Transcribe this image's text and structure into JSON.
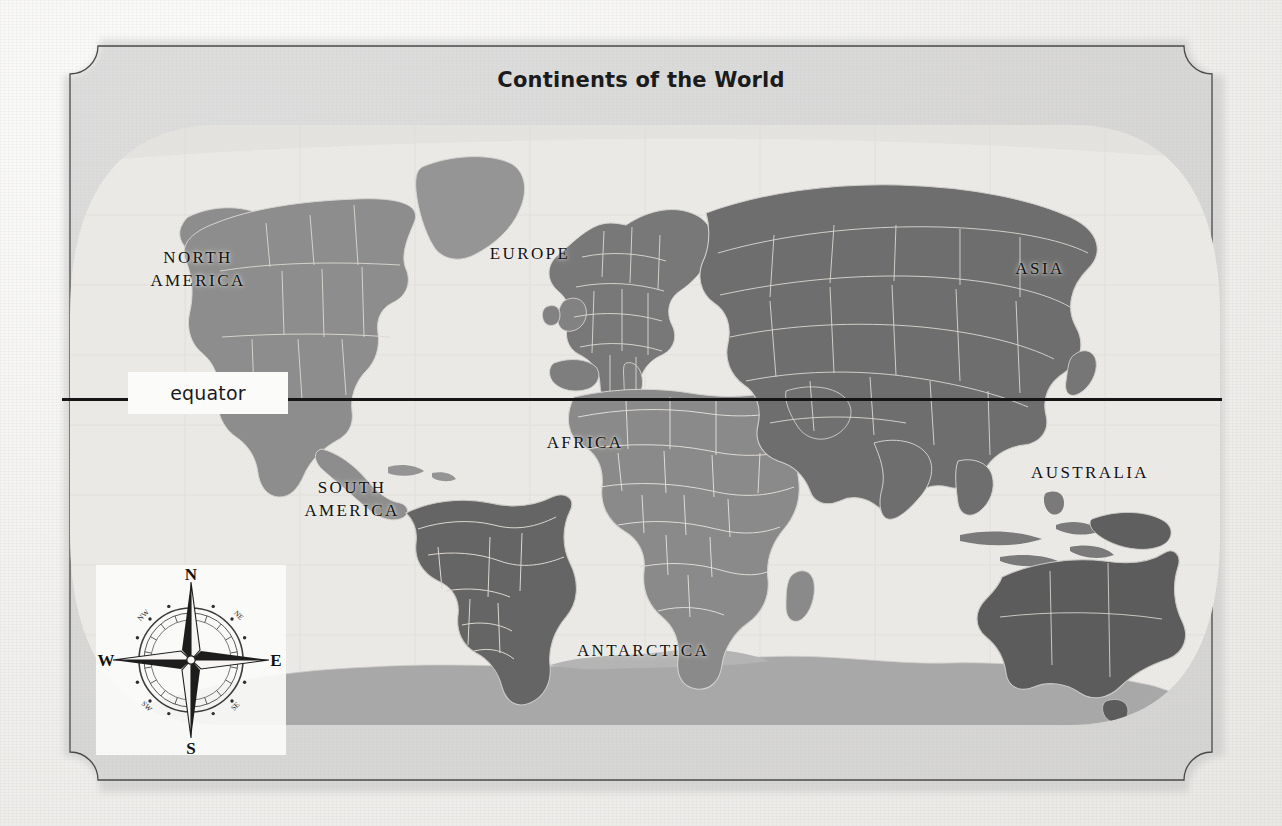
{
  "map": {
    "title": "Continents of the World",
    "equator": {
      "label": "equator"
    },
    "continents": [
      {
        "name": "NORTH\nAMERICA",
        "key": "north-america",
        "x": 128,
        "y": 247,
        "w": 140,
        "shade": "#8c8c8c"
      },
      {
        "name": "SOUTH\nAMERICA",
        "key": "south-america",
        "x": 282,
        "y": 477,
        "w": 140,
        "shade": "#6d6d6d"
      },
      {
        "name": "EUROPE",
        "key": "europe",
        "x": 445,
        "y": 243,
        "w": 170,
        "shade": "#7a7a7a"
      },
      {
        "name": "AFRICA",
        "key": "africa",
        "x": 500,
        "y": 432,
        "w": 170,
        "shade": "#8c8c8c"
      },
      {
        "name": "ASIA",
        "key": "asia",
        "x": 955,
        "y": 258,
        "w": 170,
        "shade": "#6f6f6f"
      },
      {
        "name": "AUSTRALIA",
        "key": "australia",
        "x": 1000,
        "y": 462,
        "w": 180,
        "shade": "#5f5f5f"
      },
      {
        "name": "ANTARCTICA",
        "key": "antarctica",
        "x": 538,
        "y": 640,
        "w": 210,
        "shade": "#aaaaaa"
      }
    ],
    "compass": {
      "north": "N",
      "south": "S",
      "east": "E",
      "west": "W",
      "northeast": "NE",
      "northwest": "NW",
      "southeast": "SE",
      "southwest": "SW"
    },
    "colors": {
      "paper": "#f4f3f1",
      "ocean": "#eceae7",
      "frame_line": "#3a3a3a",
      "equator_line": "#151515",
      "label_text": "#121212",
      "land_dark": "#5f5f5f",
      "land_mid": "#7a7a7a",
      "land_light": "#aaaaaa",
      "border_line": "#d8d6d2"
    }
  }
}
